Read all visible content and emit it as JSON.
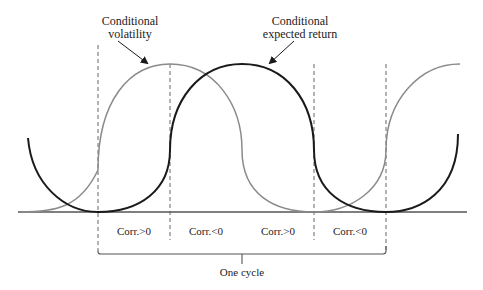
{
  "diagram": {
    "labels": {
      "volatility_line1": "Conditional",
      "volatility_line2": "volatility",
      "return_line1": "Conditional",
      "return_line2": "expected return",
      "cycle": "One cycle"
    },
    "regions": [
      {
        "label": "Corr.>0"
      },
      {
        "label": "Corr.<0"
      },
      {
        "label": "Corr.>0"
      },
      {
        "label": "Corr.<0"
      }
    ],
    "series": [
      {
        "name": "Conditional volatility",
        "color": "#8a8a8a",
        "peak_x": 170,
        "trough_x": 314
      },
      {
        "name": "Conditional expected return",
        "color": "#1a1a1a",
        "peak_x": 242,
        "trough_x": [
          98,
          386
        ]
      }
    ],
    "colors": {
      "axis": "#555555",
      "volatility": "#8a8a8a",
      "return": "#1a1a1a",
      "dashed": "#666666"
    }
  }
}
